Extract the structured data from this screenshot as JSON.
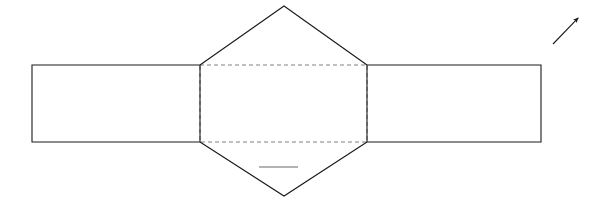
{
  "canvas": {
    "width": 615,
    "height": 213,
    "background_color": "#ffffff"
  },
  "figure": {
    "title": "",
    "stroke_color": "#1a1a1a",
    "dashed_stroke_color": "#808080",
    "accent_gray": "#999999",
    "stroke_width": 1.1,
    "dash_pattern": "4 3",
    "shapes": [
      {
        "name": "left-rectangle",
        "kind": "rectangle",
        "style": "solid",
        "points": "32,65 200,65 200,142 32,142"
      },
      {
        "name": "right-rectangle",
        "kind": "rectangle",
        "style": "solid",
        "points": "367,65 541,65 541,142 367,142"
      },
      {
        "name": "center-rectangle",
        "kind": "rectangle",
        "style": "dashed",
        "points": "200,65 367,65 367,142 200,142"
      },
      {
        "name": "top-triangle",
        "kind": "triangle",
        "style": "solid",
        "points": "200,65 284,6 367,65"
      },
      {
        "name": "bottom-triangle",
        "kind": "triangle",
        "style": "solid",
        "points": "200,142 284,196 367,142"
      }
    ],
    "marks": [
      {
        "name": "gray-tick-mark",
        "kind": "line",
        "style": "solid",
        "color": "#9a9a9a",
        "x1": 259,
        "y1": 167,
        "x2": 298,
        "y2": 167
      },
      {
        "name": "direction-arrow",
        "kind": "arrow",
        "style": "solid",
        "color": "#1a1a1a",
        "x1": 553,
        "y1": 44,
        "x2": 580,
        "y2": 16
      }
    ],
    "labels": []
  }
}
